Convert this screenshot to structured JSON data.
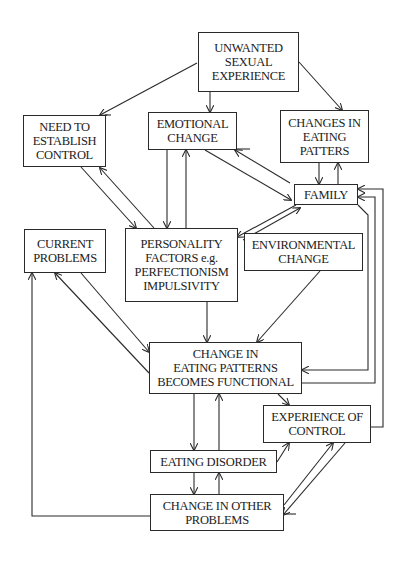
{
  "diagram": {
    "type": "flow",
    "nodes": [
      {
        "id": "unwanted",
        "label": "UNWANTED\nSEXUAL\nEXPERIENCE"
      },
      {
        "id": "need_control",
        "label": "NEED TO\nESTABLISH\nCONTROL"
      },
      {
        "id": "emotional",
        "label": "EMOTIONAL\nCHANGE"
      },
      {
        "id": "changes_eating",
        "label": "CHANGES IN\nEATING\nPATTERS"
      },
      {
        "id": "family",
        "label": "FAMILY"
      },
      {
        "id": "current_problems",
        "label": "CURRENT\nPROBLEMS"
      },
      {
        "id": "personality",
        "label": "PERSONALITY\nFACTORS e.g.\nPERFECTIONISM\nIMPULSIVITY"
      },
      {
        "id": "environmental",
        "label": "ENVIRONMENTAL\nCHANGE"
      },
      {
        "id": "functional",
        "label": "CHANGE IN\nEATING PATTERNS\nBECOMES FUNCTIONAL"
      },
      {
        "id": "experience_control",
        "label": "EXPERIENCE OF\nCONTROL"
      },
      {
        "id": "eating_disorder",
        "label": "EATING DISORDER"
      },
      {
        "id": "other_problems",
        "label": "CHANGE IN OTHER\nPROBLEMS"
      }
    ],
    "edges": [
      {
        "from": "unwanted",
        "to": "need_control"
      },
      {
        "from": "unwanted",
        "to": "emotional"
      },
      {
        "from": "unwanted",
        "to": "changes_eating"
      },
      {
        "from": "need_control",
        "to": "personality"
      },
      {
        "from": "personality",
        "to": "need_control"
      },
      {
        "from": "emotional",
        "to": "personality"
      },
      {
        "from": "personality",
        "to": "emotional"
      },
      {
        "from": "emotional",
        "to": "family"
      },
      {
        "from": "family",
        "to": "emotional"
      },
      {
        "from": "changes_eating",
        "to": "family"
      },
      {
        "from": "family",
        "to": "changes_eating"
      },
      {
        "from": "family",
        "to": "personality"
      },
      {
        "from": "personality",
        "to": "family"
      },
      {
        "from": "family",
        "to": "functional"
      },
      {
        "from": "functional",
        "to": "family"
      },
      {
        "from": "experience_control",
        "to": "family"
      },
      {
        "from": "current_problems",
        "to": "functional"
      },
      {
        "from": "functional",
        "to": "current_problems"
      },
      {
        "from": "personality",
        "to": "functional"
      },
      {
        "from": "environmental",
        "to": "functional"
      },
      {
        "from": "functional",
        "to": "eating_disorder"
      },
      {
        "from": "eating_disorder",
        "to": "functional"
      },
      {
        "from": "functional",
        "to": "experience_control"
      },
      {
        "from": "eating_disorder",
        "to": "experience_control"
      },
      {
        "from": "eating_disorder",
        "to": "other_problems"
      },
      {
        "from": "other_problems",
        "to": "eating_disorder"
      },
      {
        "from": "experience_control",
        "to": "other_problems"
      },
      {
        "from": "other_problems",
        "to": "experience_control"
      },
      {
        "from": "other_problems",
        "to": "current_problems"
      }
    ]
  },
  "colors": {
    "stroke": "#2a2a2a",
    "text": "#222222",
    "background": "#ffffff"
  }
}
